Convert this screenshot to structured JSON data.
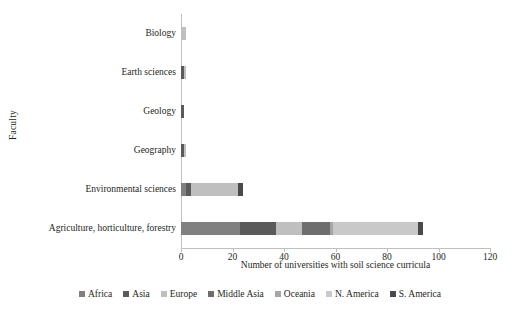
{
  "chart_data": {
    "type": "bar",
    "orientation": "horizontal",
    "stacked": true,
    "title": "",
    "xlabel": "Number of universities with soil science curricula",
    "ylabel": "Faculty",
    "xlim": [
      0,
      120
    ],
    "xticks": [
      0,
      20,
      40,
      60,
      80,
      100,
      120
    ],
    "grid": false,
    "legend_position": "bottom",
    "categories": [
      "Biology",
      "Earth sciences",
      "Geology",
      "Geography",
      "Environmental sciences",
      "Agriculture, horticulture, forestry"
    ],
    "series": [
      {
        "name": "Africa",
        "color": "#808080",
        "values": [
          0,
          0,
          0,
          0,
          2,
          23
        ]
      },
      {
        "name": "Asia",
        "color": "#5a5a5a",
        "values": [
          0,
          1,
          1,
          1,
          2,
          14
        ]
      },
      {
        "name": "Europe",
        "color": "#bfbfbf",
        "values": [
          2,
          1,
          0,
          1,
          18,
          10
        ]
      },
      {
        "name": "Middle Asia",
        "color": "#6e6e6e",
        "values": [
          0,
          0,
          0,
          0,
          0,
          11
        ]
      },
      {
        "name": "Oceania",
        "color": "#a6a6a6",
        "values": [
          0,
          0,
          0,
          0,
          0,
          1
        ]
      },
      {
        "name": "N. America",
        "color": "#c9c9c9",
        "values": [
          0,
          0,
          0,
          0,
          0,
          33
        ]
      },
      {
        "name": "S. America",
        "color": "#4a4a4a",
        "values": [
          0,
          0,
          0,
          0,
          2,
          2
        ]
      }
    ],
    "totals": [
      2,
      2,
      1,
      2,
      24,
      94
    ]
  }
}
